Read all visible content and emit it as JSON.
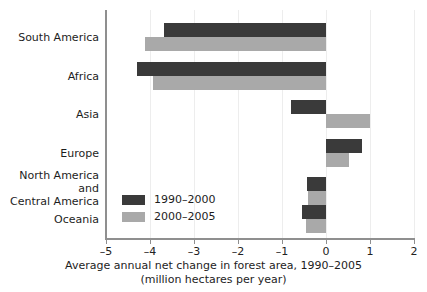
{
  "chart_data": {
    "type": "bar",
    "orientation": "horizontal",
    "title": "",
    "xlabel": "Average annual net change in forest area, 1990–2005",
    "xlabel_line2": "(million hectares per year)",
    "ylabel": "",
    "xlim": [
      -5,
      2
    ],
    "xticks": [
      -5,
      -4,
      -3,
      -2,
      -1,
      0,
      1,
      2
    ],
    "xticklabels": [
      "–5",
      "–4",
      "–3",
      "–2",
      "–1",
      "0",
      "1",
      "2"
    ],
    "grid": false,
    "legend_position": "inside-lower-left",
    "categories": [
      "South America",
      "Africa",
      "Asia",
      "Europe",
      "North America and\nCentral America",
      "Oceania"
    ],
    "series": [
      {
        "name": "1990–2000",
        "color": "#3a3a3a",
        "values": [
          -3.68,
          -4.3,
          -0.79,
          0.82,
          -0.43,
          -0.55
        ]
      },
      {
        "name": "2000–2005",
        "color": "#a9a9a9",
        "values": [
          -4.12,
          -3.93,
          1.0,
          0.52,
          -0.41,
          -0.45
        ]
      }
    ]
  },
  "axis": {
    "line_color": "#8f8f8f"
  }
}
